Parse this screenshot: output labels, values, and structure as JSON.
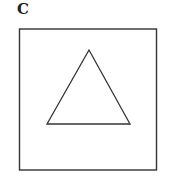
{
  "panel": {
    "label": "C"
  },
  "figure": {
    "square": {
      "x": 19.5,
      "y": 29,
      "width": 137,
      "height": 141,
      "stroke": "#333333",
      "stroke_width": 1.4
    },
    "triangle": {
      "points": "89,50 47,124 130,124",
      "stroke": "#333333",
      "stroke_width": 1.3
    }
  }
}
